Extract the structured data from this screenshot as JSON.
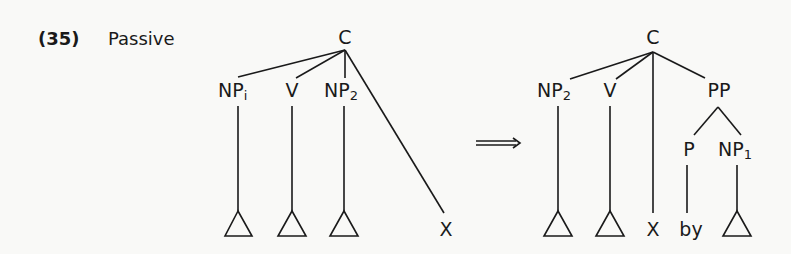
{
  "example": {
    "number": "(35)",
    "title": "Passive"
  },
  "arrow": {
    "symbol": "⟹",
    "meaning": "transforms-to"
  },
  "left_tree": {
    "root": "C",
    "children": [
      {
        "label": "NP",
        "sub": "i",
        "leaf": "triangle"
      },
      {
        "label": "V",
        "sub": "",
        "leaf": "triangle"
      },
      {
        "label": "NP",
        "sub": "2",
        "leaf": "triangle"
      },
      {
        "label": "",
        "sub": "",
        "leaf": "X"
      }
    ],
    "x_label": "X"
  },
  "right_tree": {
    "root": "C",
    "children": [
      {
        "label": "NP",
        "sub": "2",
        "leaf": "triangle"
      },
      {
        "label": "V",
        "sub": "",
        "leaf": "triangle"
      },
      {
        "label": "",
        "sub": "",
        "leaf": "X"
      },
      {
        "label": "PP",
        "sub": "",
        "children": [
          {
            "label": "P",
            "sub": "",
            "leaf": "by"
          },
          {
            "label": "NP",
            "sub": "1",
            "leaf": "triangle"
          }
        ]
      }
    ],
    "x_label": "X",
    "by_label": "by"
  }
}
